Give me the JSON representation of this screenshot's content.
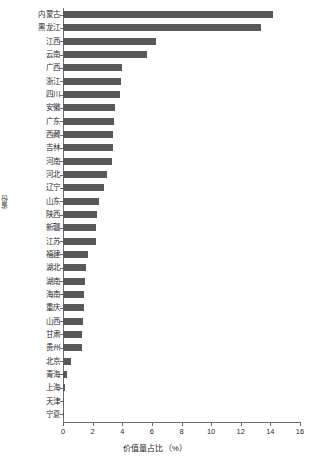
{
  "chart_data": {
    "type": "bar",
    "orientation": "horizontal",
    "title": "",
    "xlabel": "价值量占比（%）",
    "ylabel": "省份",
    "xlim": [
      0,
      16
    ],
    "xticks": [
      0,
      2,
      4,
      6,
      8,
      10,
      12,
      14,
      16
    ],
    "grid": false,
    "legend": null,
    "bar_color": "#595959",
    "axis_color": "#6e6e6e",
    "categories": [
      "内蒙古",
      "黑龙江",
      "江西",
      "云南",
      "广西",
      "浙江",
      "四川",
      "安徽",
      "广东",
      "西藏",
      "吉林",
      "河南",
      "河北",
      "辽宁",
      "山东",
      "陕西",
      "新疆",
      "江苏",
      "福建",
      "湖北",
      "湖南",
      "海南",
      "重庆",
      "山西",
      "甘肃",
      "贵州",
      "北京",
      "青海",
      "上海",
      "天津",
      "宁夏"
    ],
    "values": [
      14.2,
      13.4,
      6.3,
      5.7,
      4.0,
      3.9,
      3.85,
      3.5,
      3.45,
      3.4,
      3.35,
      3.3,
      3.0,
      2.75,
      2.4,
      2.3,
      2.25,
      2.2,
      1.7,
      1.55,
      1.5,
      1.45,
      1.4,
      1.35,
      1.3,
      1.25,
      0.55,
      0.3,
      0.12,
      0.1,
      0.08
    ]
  }
}
